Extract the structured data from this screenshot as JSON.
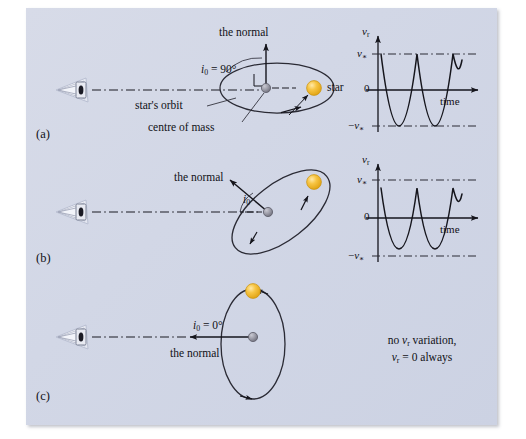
{
  "figure": {
    "background_color": "#d3d8e7",
    "page_color": "#ffffff",
    "line_color": "#1a1a22",
    "star_color": "#f0b323",
    "com_color": "#8a8a96",
    "panels": [
      {
        "id": "a",
        "letter": "(a)",
        "inclination_label": "i0 = 90°",
        "inclination_value": "90°",
        "normal_label": "the normal",
        "orbit_label": "star's orbit",
        "com_label": "centre of mass",
        "star_label": "star",
        "orbit_orientation": "edge-on",
        "graph": {
          "y_axis_label": "vr",
          "x_axis_label": "time",
          "zero_label": "0",
          "upper_label": "v*",
          "lower_label": "−v*",
          "amplitude_fraction": 1.0,
          "cycles": 2.5,
          "has_dashed_guides": true
        }
      },
      {
        "id": "b",
        "letter": "(b)",
        "inclination_label": "i0",
        "inclination_value": "intermediate",
        "normal_label": "the normal",
        "orbit_orientation": "inclined",
        "graph": {
          "y_axis_label": "vr",
          "x_axis_label": "time",
          "zero_label": "0",
          "upper_label": "v*",
          "lower_label": "−v*",
          "amplitude_fraction": 0.8,
          "cycles": 2.5,
          "has_dashed_guides": true
        }
      },
      {
        "id": "c",
        "letter": "(c)",
        "inclination_label": "i0 = 0°",
        "inclination_value": "0°",
        "normal_label": "the normal",
        "orbit_orientation": "face-on",
        "note_line_1": "no vr variation,",
        "note_line_2": "vr = 0 always"
      }
    ],
    "symbols": {
      "i_sub": "i",
      "i_subscript": "0",
      "v_sub": "v",
      "v_subscript_r": "r",
      "v_star": "v*",
      "v_star_neg": "−v*",
      "deg_90": "90°",
      "deg_0": "0°",
      "equals": "="
    },
    "observer_icon_name": "observer-eye-icon"
  }
}
